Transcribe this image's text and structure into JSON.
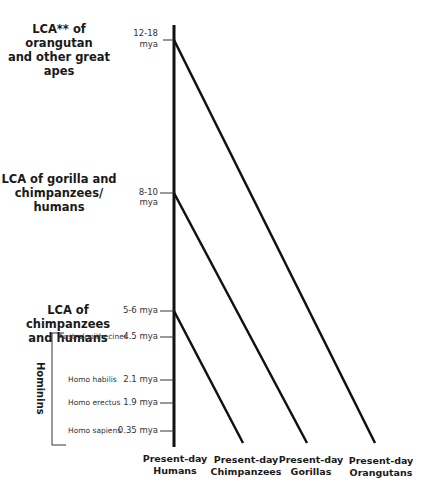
{
  "nodes": [
    {
      "label_lines": [
        "LCA** of orangutan",
        "and other great",
        "apes"
      ],
      "time_lines": [
        "12-18",
        "mya"
      ]
    },
    {
      "label_lines": [
        "LCA of gorilla and",
        "chimpanzees/",
        "humans"
      ],
      "time": "8-10 mya"
    },
    {
      "label_lines": [
        "LCA of chimpanzees",
        "and humans"
      ],
      "time": "5-6 mya"
    }
  ],
  "hominins": {
    "group_label": "Hominins",
    "taxa": [
      {
        "name": "Australopithecines",
        "time": "4.5 mya"
      },
      {
        "name": "Homo habilis",
        "time": "2.1 mya"
      },
      {
        "name": "Homo erectus",
        "time": "1.9 mya"
      },
      {
        "name": "Homo sapiens",
        "time": "0.35 mya"
      }
    ]
  },
  "present_day": [
    {
      "line1": "Present-day",
      "line2": "Humans"
    },
    {
      "line1": "Present-day",
      "line2": "Chimpanzees"
    },
    {
      "line1": "Present-day",
      "line2": "Gorillas"
    },
    {
      "line1": "Present-day",
      "line2": "Orangutans"
    }
  ],
  "colors": {
    "line": "#111111",
    "text": "#1a1a1a"
  }
}
